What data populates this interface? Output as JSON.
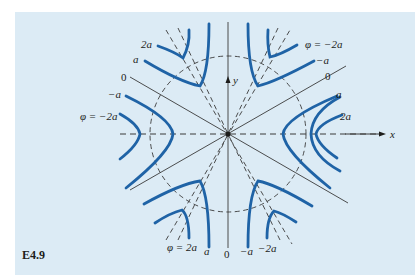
{
  "figure": {
    "label": "E4.9",
    "background_color": "#dcebf5",
    "curve_color": "#1f63a6",
    "line_color": "#3a3a3a",
    "axes": {
      "x_label": "x",
      "y_label": "y"
    },
    "labels": {
      "top_left": [
        "2a",
        "a",
        "0",
        "−a",
        "φ = −2a"
      ],
      "top_right": [
        "φ = −2a",
        "−a",
        "0",
        "a",
        "2a"
      ],
      "bottom": [
        "φ = 2a",
        "a",
        "0",
        "−a",
        "−2a"
      ]
    }
  }
}
